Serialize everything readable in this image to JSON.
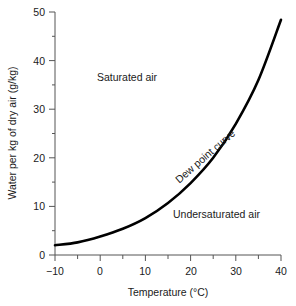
{
  "chart_data": {
    "type": "line",
    "title": "",
    "xlabel": "Temperature (°C)",
    "ylabel": "Water per kg of dry air (g/kg)",
    "xlim": [
      -10,
      40
    ],
    "ylim": [
      0,
      50
    ],
    "grid": false,
    "legend": "none",
    "x_major_ticks": [
      -10,
      0,
      10,
      20,
      30,
      40
    ],
    "x_tick_labels": [
      "−10",
      "0",
      "10",
      "20",
      "30",
      "40"
    ],
    "x_minor_ticks": [
      -5,
      5,
      15,
      25,
      35
    ],
    "y_major_ticks": [
      0,
      10,
      20,
      30,
      40,
      50
    ],
    "y_tick_labels": [
      "0",
      "10",
      "20",
      "30",
      "40",
      "50"
    ],
    "y_minor_ticks": [
      5,
      15,
      25,
      35,
      45
    ],
    "series": [
      {
        "name": "Dew point curve",
        "color": "#000000",
        "x": [
          -10,
          -5,
          0,
          5,
          10,
          15,
          20,
          25,
          30,
          35,
          40
        ],
        "y": [
          2.0,
          2.6,
          3.8,
          5.4,
          7.6,
          10.7,
          14.8,
          20.0,
          27.0,
          36.0,
          48.4
        ]
      }
    ],
    "annotations": [
      {
        "text": "Saturated air",
        "x": -1.0,
        "y": 37.0
      },
      {
        "text": "Dew point curve",
        "x": 23.2,
        "y": 20.5,
        "rotation": -41
      },
      {
        "text": "Undersaturated air",
        "x": 16.0,
        "y": 9.0
      }
    ]
  },
  "axes": {
    "x_title": "Temperature (°C)",
    "y_title": "Water per kg of dry air (g/kg)",
    "x_labels": [
      "−10",
      "0",
      "10",
      "20",
      "30",
      "40"
    ],
    "y_labels": [
      "0",
      "10",
      "20",
      "30",
      "40",
      "50"
    ]
  },
  "labels": {
    "saturated": "Saturated air",
    "undersaturated": "Undersaturated air",
    "curve": "Dew point curve"
  },
  "colors": {
    "curve": "#000000",
    "axis": "#555555",
    "text": "#1a1a1a",
    "background": "#ffffff"
  }
}
